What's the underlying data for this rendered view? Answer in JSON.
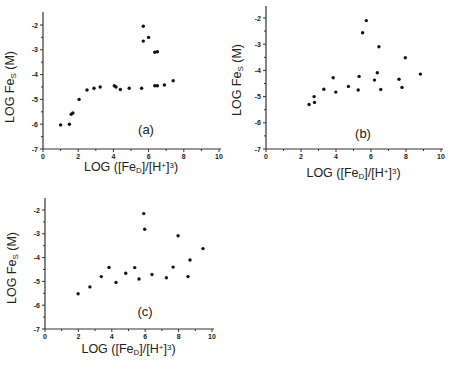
{
  "figure": {
    "background": "#ffffff",
    "point_color": "#111111"
  },
  "chart_data": [
    {
      "type": "scatter",
      "panel_label": "(a)",
      "title": "",
      "xlabel": "LOG ([Fe_D]/[H+]^3)",
      "ylabel": "LOG Fe_S (M)",
      "xlim": [
        0,
        10
      ],
      "ylim": [
        -7,
        -2
      ],
      "xticks": [
        "0",
        "2",
        "4",
        "6",
        "8",
        "10"
      ],
      "yticks": [
        "-2",
        "-3",
        "-4",
        "-5",
        "-6",
        "-7"
      ],
      "grid": false,
      "legend": null,
      "points": [
        [
          1.0,
          -6.03
        ],
        [
          1.5,
          -6.0
        ],
        [
          1.6,
          -5.6
        ],
        [
          1.7,
          -5.55
        ],
        [
          2.05,
          -5.0
        ],
        [
          2.5,
          -4.62
        ],
        [
          2.9,
          -4.55
        ],
        [
          3.25,
          -4.5
        ],
        [
          4.05,
          -4.45
        ],
        [
          4.15,
          -4.5
        ],
        [
          4.4,
          -4.6
        ],
        [
          4.9,
          -4.55
        ],
        [
          5.6,
          -4.55
        ],
        [
          5.7,
          -2.05
        ],
        [
          5.7,
          -2.65
        ],
        [
          6.0,
          -2.5
        ],
        [
          6.35,
          -3.1
        ],
        [
          6.5,
          -3.08
        ],
        [
          6.35,
          -4.45
        ],
        [
          6.5,
          -4.45
        ],
        [
          6.9,
          -4.42
        ],
        [
          7.4,
          -4.25
        ]
      ]
    },
    {
      "type": "scatter",
      "panel_label": "(b)",
      "title": "",
      "xlabel": "LOG ([Fe_D]/[H+]^3)",
      "ylabel": "LOG Fe_S (M)",
      "xlim": [
        0,
        10
      ],
      "ylim": [
        -7,
        -2
      ],
      "xticks": [
        "0",
        "2",
        "4",
        "6",
        "8",
        "10"
      ],
      "yticks": [
        "-2",
        "-3",
        "-4",
        "-5",
        "-6",
        "-7"
      ],
      "grid": false,
      "legend": null,
      "points": [
        [
          2.46,
          -5.3
        ],
        [
          2.75,
          -5.0
        ],
        [
          2.77,
          -5.22
        ],
        [
          3.3,
          -4.72
        ],
        [
          3.84,
          -4.28
        ],
        [
          3.99,
          -4.83
        ],
        [
          4.71,
          -4.61
        ],
        [
          5.27,
          -4.75
        ],
        [
          5.32,
          -4.23
        ],
        [
          5.52,
          -2.56
        ],
        [
          5.73,
          -2.1
        ],
        [
          6.2,
          -4.37
        ],
        [
          6.36,
          -4.09
        ],
        [
          6.45,
          -3.1
        ],
        [
          6.56,
          -4.73
        ],
        [
          7.6,
          -4.34
        ],
        [
          7.77,
          -4.65
        ],
        [
          7.96,
          -3.52
        ],
        [
          8.82,
          -4.14
        ]
      ]
    },
    {
      "type": "scatter",
      "panel_label": "(c)",
      "title": "",
      "xlabel": "LOG ([Fe_D]/[H+]^3)",
      "ylabel": "LOG Fe_S (M)",
      "xlim": [
        0,
        10
      ],
      "ylim": [
        -7,
        -2
      ],
      "xticks": [
        "0",
        "2",
        "4",
        "6",
        "8",
        "10"
      ],
      "yticks": [
        "-2",
        "-3",
        "-4",
        "-5",
        "-6",
        "-7"
      ],
      "grid": false,
      "legend": null,
      "points": [
        [
          1.98,
          -5.52
        ],
        [
          2.69,
          -5.23
        ],
        [
          3.37,
          -4.8
        ],
        [
          3.83,
          -4.41
        ],
        [
          4.25,
          -5.04
        ],
        [
          4.83,
          -4.66
        ],
        [
          5.37,
          -4.42
        ],
        [
          5.63,
          -4.9
        ],
        [
          5.91,
          -2.15
        ],
        [
          5.97,
          -2.81
        ],
        [
          6.41,
          -4.71
        ],
        [
          7.27,
          -4.85
        ],
        [
          7.67,
          -4.4
        ],
        [
          7.97,
          -3.08
        ],
        [
          8.56,
          -4.8
        ],
        [
          8.68,
          -4.1
        ],
        [
          9.46,
          -3.62
        ]
      ]
    }
  ],
  "layout": {
    "panels": [
      {
        "x0": 43,
        "x10": 219,
        "yTop": 25,
        "yBottom": 149,
        "axisTop": 12,
        "labelPos": [
          146,
          134
        ],
        "xTitleY": 171,
        "yTitleX": 14,
        "yTitleY": 87
      },
      {
        "x0": 266,
        "x10": 441,
        "yTop": 18,
        "yBottom": 149,
        "axisTop": 6,
        "labelPos": [
          363,
          138
        ],
        "xTitleY": 177,
        "yTitleX": 241,
        "yTitleY": 80
      },
      {
        "x0": 45,
        "x10": 212,
        "yTop": 210,
        "yBottom": 329,
        "axisTop": 198,
        "labelPos": [
          145,
          316
        ],
        "xTitleY": 353,
        "yTitleX": 16,
        "yTitleY": 268
      }
    ]
  }
}
